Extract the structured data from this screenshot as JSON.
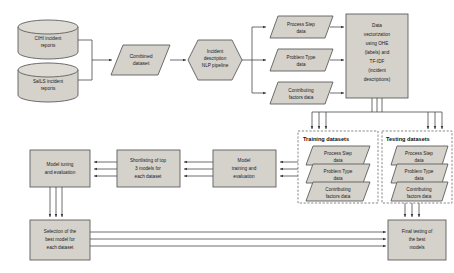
{
  "diagram": {
    "colors": {
      "shape_fill": "#d5d2cb",
      "shape_stroke": "#5e5e5e",
      "connector": "#4a4a4a",
      "dashed_border": "#6a6a6a",
      "background": "#ffffff",
      "text": "#1a1a1a"
    },
    "sources": [
      {
        "id": "cihi",
        "label_lines": [
          "CIHI incident",
          "reports"
        ],
        "shape": "cylinder"
      },
      {
        "id": "sails",
        "label_lines": [
          "SaILS incident",
          "reports"
        ],
        "shape": "cylinder"
      }
    ],
    "stage1": [
      {
        "id": "combined",
        "label_lines": [
          "Combined",
          "dataset"
        ],
        "shape": "parallelogram"
      },
      {
        "id": "nlp",
        "label_lines": [
          "Incident",
          "description",
          "NLP pipeline"
        ],
        "shape": "hexagon"
      }
    ],
    "extracted": [
      {
        "id": "process-step",
        "label_lines": [
          "Process Step",
          "data"
        ],
        "shape": "parallelogram"
      },
      {
        "id": "problem-type",
        "label_lines": [
          "Problem Type",
          "data"
        ],
        "shape": "parallelogram"
      },
      {
        "id": "contributing-factors",
        "label_lines": [
          "Contributing",
          "factors data"
        ],
        "shape": "parallelogram"
      }
    ],
    "vectorization": {
      "id": "vectorization",
      "label_lines": [
        "Data",
        "vectorization",
        "using OHE",
        "(labels) and",
        "TF-IDF",
        "(incident",
        "descriptions)"
      ],
      "shape": "rectangle"
    },
    "dataset_groups": [
      {
        "id": "training",
        "header": "Training datasets",
        "items": [
          {
            "id": "train-process-step",
            "label_lines": [
              "Process Step",
              "data"
            ]
          },
          {
            "id": "train-problem-type",
            "label_lines": [
              "Problem Type",
              "data"
            ]
          },
          {
            "id": "train-contributing",
            "label_lines": [
              "Contributing",
              "factors data"
            ]
          }
        ]
      },
      {
        "id": "testing",
        "header": "Testing datasets",
        "items": [
          {
            "id": "test-process-step",
            "label_lines": [
              "Process Step",
              "data"
            ]
          },
          {
            "id": "test-problem-type",
            "label_lines": [
              "Problem Type",
              "data"
            ]
          },
          {
            "id": "test-contributing",
            "label_lines": [
              "Contributing",
              "factors data"
            ]
          }
        ]
      }
    ],
    "model_stages": [
      {
        "id": "model-training",
        "label_lines": [
          "Model",
          "training and",
          "evaluation"
        ],
        "shape": "rectangle"
      },
      {
        "id": "shortlisting",
        "label_lines": [
          "Shortlisting of top",
          "3 models for",
          "each dataset"
        ],
        "shape": "rectangle"
      },
      {
        "id": "model-tuning",
        "label_lines": [
          "Model tuning",
          "and evaluation"
        ],
        "shape": "rectangle"
      },
      {
        "id": "selection",
        "label_lines": [
          "Selection of the",
          "best model for",
          "each dataset"
        ],
        "shape": "rectangle"
      },
      {
        "id": "final-testing",
        "label_lines": [
          "Final testing of",
          "the best",
          "models"
        ],
        "shape": "rectangle"
      }
    ]
  }
}
